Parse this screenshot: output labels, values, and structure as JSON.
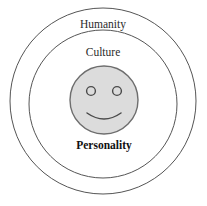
{
  "diagram": {
    "type": "concentric-circles",
    "background_color": "#ffffff",
    "rings": [
      {
        "id": "humanity",
        "label": "Humanity",
        "level": 1,
        "center_x": 103,
        "center_y": 101,
        "radius": 93,
        "fill_color": "#ffffff",
        "stroke_color": "#555555",
        "stroke_width": 1,
        "label_x": 103,
        "label_y": 28,
        "label_bold": false
      },
      {
        "id": "culture",
        "label": "Culture",
        "level": 2,
        "center_x": 103,
        "center_y": 104,
        "radius": 74,
        "fill_color": "#ffffff",
        "stroke_color": "#555555",
        "stroke_width": 1,
        "label_x": 103,
        "label_y": 56,
        "label_bold": false
      },
      {
        "id": "personality",
        "label": "Personality",
        "level": 3,
        "center_x": 104,
        "center_y": 100,
        "radius": 34,
        "fill_color": "#dcdcdc",
        "stroke_color": "#6e6e6e",
        "stroke_width": 1.4,
        "label_x": 104,
        "label_y": 149,
        "label_bold": true
      }
    ],
    "smiley": {
      "name": "smiley-face",
      "center_x": 104,
      "center_y": 100,
      "radius": 34,
      "face_fill": "#dcdcdc",
      "face_stroke": "#6e6e6e",
      "eyes": [
        {
          "cx": 91,
          "cy": 91,
          "r": 4.4,
          "fill": "#dcdcdc",
          "stroke": "#4a4a4a",
          "stroke_width": 1.4
        },
        {
          "cx": 117,
          "cy": 91,
          "r": 4.4,
          "fill": "#dcdcdc",
          "stroke": "#4a4a4a",
          "stroke_width": 1.4
        }
      ],
      "mouth": {
        "path": "M 87 113 Q 104 125 121 113",
        "stroke": "#4a4a4a",
        "stroke_width": 1.5
      }
    }
  }
}
